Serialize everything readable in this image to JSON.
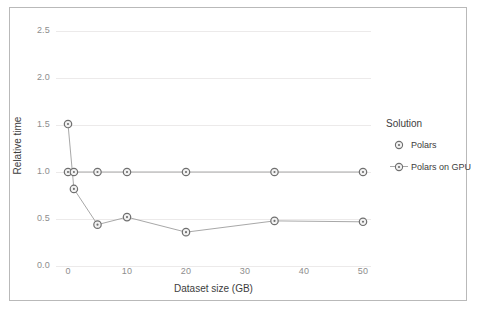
{
  "chart_data": {
    "type": "line",
    "title": "",
    "xlabel": "Dataset size (GB)",
    "ylabel": "Relative time",
    "xlim": [
      -2.5,
      54
    ],
    "ylim": [
      -0.12,
      2.72
    ],
    "xticks": [
      "0",
      "10",
      "20",
      "30",
      "40",
      "50"
    ],
    "xtick_values": [
      0,
      10,
      20,
      30,
      40,
      50
    ],
    "yticks": [
      "0.0",
      "0.5",
      "1.0",
      "1.5",
      "2.0",
      "2.5"
    ],
    "ytick_values": [
      0.0,
      0.5,
      1.0,
      1.5,
      2.0,
      2.5
    ],
    "grid": "horizontal",
    "legend_position": "right",
    "legend_title": "Solution",
    "x": [
      0,
      1,
      5,
      10,
      20,
      35,
      50
    ],
    "series": [
      {
        "name": "Polars",
        "color": "#a8a8a8",
        "values": [
          1.0,
          1.0,
          1.0,
          1.0,
          1.0,
          1.0,
          1.0
        ]
      },
      {
        "name": "Polars on GPU",
        "color": "#a8a8a8",
        "values": [
          1.51,
          0.82,
          0.44,
          0.52,
          0.36,
          0.48,
          0.47
        ]
      }
    ]
  },
  "legend": {
    "title": "Solution",
    "items": [
      {
        "label": "Polars",
        "marker": "circle-dot-marker",
        "has_line": false
      },
      {
        "label": "Polars on GPU",
        "marker": "circle-dot-marker",
        "has_line": true
      }
    ]
  },
  "axes": {
    "x_label": "Dataset size (GB)",
    "y_label": "Relative time"
  },
  "colors": {
    "frame_border": "#b9b9b9",
    "gridline": "#eceaea",
    "tick_text": "#8d8d8d",
    "axis_text": "#3d3d3d",
    "series_line": "#a8a8a8",
    "marker_stroke": "#6f6f6f",
    "marker_fill": "#f2f2f2",
    "background": "#ffffff"
  }
}
